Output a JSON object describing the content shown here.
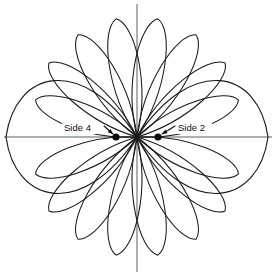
{
  "figure": {
    "background_color": "#ffffff",
    "stroke_color": "#1a1a1a",
    "axis_color": "#4d4d4d",
    "marker_color": "#0d0d0d",
    "width": 276,
    "height": 276,
    "center": {
      "x": 137,
      "y": 137
    }
  },
  "axes": {
    "horizontal": {
      "x1": 4,
      "y1": 137,
      "x2": 272,
      "y2": 137
    },
    "vertical": {
      "x1": 137,
      "y1": 4,
      "x2": 137,
      "y2": 272
    }
  },
  "annotations": [
    {
      "id": "side-4",
      "label": "Side 4",
      "text_x": 64,
      "text_y": 131,
      "dot_x": 116,
      "dot_y": 137,
      "dot_r": 3.6,
      "leader_x1": 104,
      "leader_y1": 126,
      "leader_x2": 113,
      "leader_y2": 134
    },
    {
      "id": "side-2",
      "label": "Side 2",
      "text_x": 178,
      "text_y": 131,
      "dot_x": 158,
      "dot_y": 137,
      "dot_r": 3.6,
      "leader_x1": 175,
      "leader_y1": 126,
      "leader_x2": 162,
      "leader_y2": 134
    }
  ],
  "chart_data": {
    "type": "line",
    "subtype": "polar-rose-radiation-pattern",
    "xlabel": "",
    "ylabel": "",
    "grid": false,
    "legend": null,
    "center": {
      "x": 137,
      "y": 137
    },
    "angle_units": "degrees",
    "radius_units": "pixels",
    "lobes": [
      {
        "index": 0,
        "angle_deg": 0,
        "radius": 131,
        "half_width_deg": 26,
        "kind": "major"
      },
      {
        "index": 1,
        "angle_deg": 20,
        "radius": 108,
        "half_width_deg": 8,
        "kind": "minor"
      },
      {
        "index": 2,
        "angle_deg": 40,
        "radius": 115,
        "half_width_deg": 8,
        "kind": "minor"
      },
      {
        "index": 3,
        "angle_deg": 60,
        "radius": 118,
        "half_width_deg": 8,
        "kind": "minor"
      },
      {
        "index": 4,
        "angle_deg": 80,
        "radius": 120,
        "half_width_deg": 8,
        "kind": "minor"
      },
      {
        "index": 5,
        "angle_deg": 100,
        "radius": 120,
        "half_width_deg": 8,
        "kind": "minor"
      },
      {
        "index": 6,
        "angle_deg": 120,
        "radius": 118,
        "half_width_deg": 8,
        "kind": "minor"
      },
      {
        "index": 7,
        "angle_deg": 140,
        "radius": 115,
        "half_width_deg": 8,
        "kind": "minor"
      },
      {
        "index": 8,
        "angle_deg": 160,
        "radius": 108,
        "half_width_deg": 8,
        "kind": "minor"
      },
      {
        "index": 9,
        "angle_deg": 180,
        "radius": 131,
        "half_width_deg": 26,
        "kind": "major"
      },
      {
        "index": 10,
        "angle_deg": 200,
        "radius": 108,
        "half_width_deg": 8,
        "kind": "minor"
      },
      {
        "index": 11,
        "angle_deg": 220,
        "radius": 115,
        "half_width_deg": 8,
        "kind": "minor"
      },
      {
        "index": 12,
        "angle_deg": 240,
        "radius": 118,
        "half_width_deg": 8,
        "kind": "minor"
      },
      {
        "index": 13,
        "angle_deg": 260,
        "radius": 120,
        "half_width_deg": 8,
        "kind": "minor"
      },
      {
        "index": 14,
        "angle_deg": 280,
        "radius": 120,
        "half_width_deg": 8,
        "kind": "minor"
      },
      {
        "index": 15,
        "angle_deg": 300,
        "radius": 118,
        "half_width_deg": 8,
        "kind": "minor"
      },
      {
        "index": 16,
        "angle_deg": 320,
        "radius": 115,
        "half_width_deg": 8,
        "kind": "minor"
      },
      {
        "index": 17,
        "angle_deg": 340,
        "radius": 108,
        "half_width_deg": 8,
        "kind": "minor"
      }
    ],
    "markers": [
      {
        "label": "Side 4",
        "angle_deg": 180,
        "radius": 21
      },
      {
        "label": "Side 2",
        "angle_deg": 0,
        "radius": 21
      }
    ]
  }
}
